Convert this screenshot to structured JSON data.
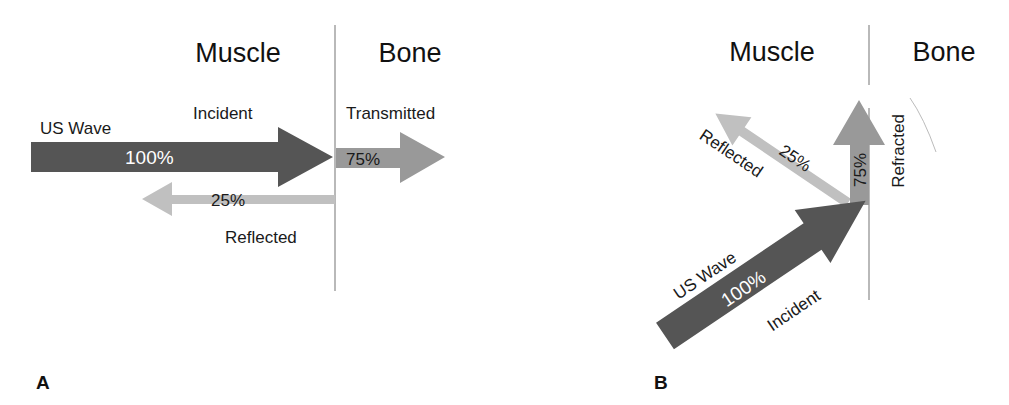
{
  "figure": {
    "panels": [
      {
        "id": "A",
        "label": "A",
        "media_left": "Muscle",
        "media_right": "Bone",
        "source_label": "US Wave",
        "incident": {
          "label": "Incident",
          "percent": "100%"
        },
        "transmitted": {
          "label": "Transmitted",
          "percent": "75%"
        },
        "reflected": {
          "label": "Reflected",
          "percent": "25%"
        }
      },
      {
        "id": "B",
        "label": "B",
        "media_left": "Muscle",
        "media_right": "Bone",
        "source_label": "US Wave",
        "incident": {
          "label": "Incident",
          "percent": "100%"
        },
        "refracted": {
          "label": "Refracted",
          "percent": "75%"
        },
        "reflected": {
          "label": "Reflected",
          "percent": "25%"
        }
      }
    ],
    "colors": {
      "incident": "#555555",
      "transmitted": "#999999",
      "reflected": "#c0c0c0",
      "interface_line": "#8a8a8a"
    }
  }
}
